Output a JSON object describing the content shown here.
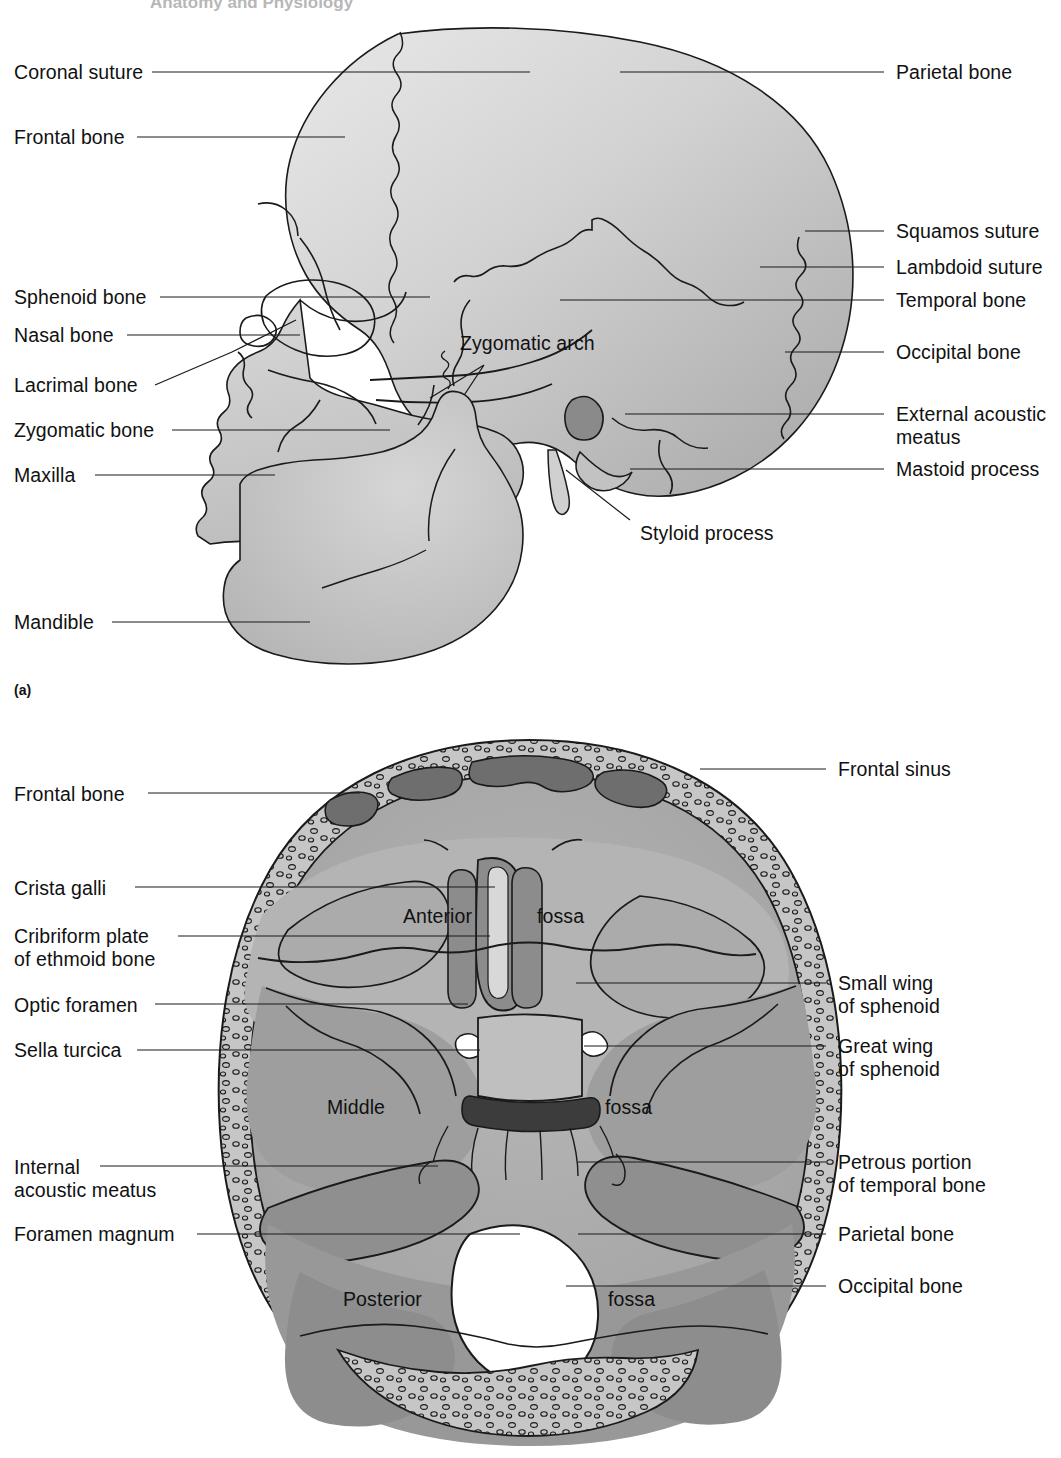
{
  "page": {
    "header_fragment": "Anatomy and Physiology"
  },
  "figures": [
    {
      "id": "lateral-skull",
      "panel_letter": "(a)",
      "view": "Lateral view of the skull",
      "labels_left": [
        {
          "text": "Coronal suture",
          "x": 14,
          "y": 60,
          "line_x1": 152,
          "line_x2": 530,
          "line_y": 72
        },
        {
          "text": "Frontal bone",
          "x": 14,
          "y": 125,
          "line_x1": 137,
          "line_x2": 345,
          "line_y": 137
        },
        {
          "text": "Sphenoid bone",
          "x": 14,
          "y": 285,
          "line_x1": 160,
          "line_x2": 430,
          "line_y": 297
        },
        {
          "text": "Nasal bone",
          "x": 14,
          "y": 323,
          "line_x1": 127,
          "line_x2": 300,
          "line_y": 335
        },
        {
          "text": "Lacrimal bone",
          "x": 14,
          "y": 378,
          "line_x1": 155,
          "line_x2": 232,
          "line_y": 385
        },
        {
          "text": "Zygomatic bone",
          "x": 14,
          "y": 418,
          "line_x1": 172,
          "line_x2": 390,
          "line_y": 430
        },
        {
          "text": "Maxilla",
          "x": 14,
          "y": 463,
          "line_x1": 95,
          "line_x2": 275,
          "line_y": 475
        },
        {
          "text": "Mandible",
          "x": 14,
          "y": 610,
          "line_x1": 112,
          "line_x2": 310,
          "line_y": 622
        }
      ],
      "labels_right": [
        {
          "text": "Parietal bone",
          "x": 896,
          "y": 60,
          "line_x1": 620,
          "line_x2": 884,
          "line_y": 72
        },
        {
          "text": "Squamos suture",
          "x": 896,
          "y": 219,
          "line_x1": 805,
          "line_x2": 884,
          "line_y": 231
        },
        {
          "text": "Lambdoid suture",
          "x": 896,
          "y": 255,
          "line_x1": 760,
          "line_x2": 884,
          "line_y": 267
        },
        {
          "text": "Temporal bone",
          "x": 896,
          "y": 288,
          "line_x1": 560,
          "line_x2": 884,
          "line_y": 300
        },
        {
          "text": "Occipital bone",
          "x": 896,
          "y": 340,
          "line_x1": 785,
          "line_x2": 884,
          "line_y": 352
        },
        {
          "text": "External acoustic",
          "x": 896,
          "y": 402,
          "line_x1": 625,
          "line_x2": 884,
          "line_y": 414
        },
        {
          "text": "meatus",
          "x": 896,
          "y": 425,
          "line_x1": 0,
          "line_x2": 0,
          "line_y": 0
        },
        {
          "text": "Mastoid process",
          "x": 896,
          "y": 457,
          "line_x1": 630,
          "line_x2": 884,
          "line_y": 469
        },
        {
          "text": "Styloid process",
          "x": 640,
          "y": 521,
          "line_x1": 0,
          "line_x2": 0,
          "line_y": 0
        }
      ],
      "inline_labels": [
        {
          "text": "Zygomatic arch",
          "x": 460,
          "y": 344
        }
      ]
    },
    {
      "id": "cranial-floor",
      "panel_letter": "",
      "view": "Superior view of the floor of the cranial cavity",
      "labels_left": [
        {
          "text": "Frontal bone",
          "x": 14,
          "y": 782,
          "line_x1": 148,
          "line_x2": 360,
          "line_y": 793
        },
        {
          "text": "Crista galli",
          "x": 14,
          "y": 876,
          "line_x1": 135,
          "line_x2": 495,
          "line_y": 887
        },
        {
          "text": "Cribriform plate",
          "x": 14,
          "y": 924,
          "line_x1": 178,
          "line_x2": 490,
          "line_y": 936
        },
        {
          "text": "of ethmoid bone",
          "x": 14,
          "y": 947,
          "line_x1": 0,
          "line_x2": 0,
          "line_y": 0
        },
        {
          "text": "Optic foramen",
          "x": 14,
          "y": 993,
          "line_x1": 155,
          "line_x2": 468,
          "line_y": 1004
        },
        {
          "text": "Sella turcica",
          "x": 14,
          "y": 1038,
          "line_x1": 137,
          "line_x2": 480,
          "line_y": 1050
        },
        {
          "text": "Internal",
          "x": 14,
          "y": 1155,
          "line_x1": 100,
          "line_x2": 438,
          "line_y": 1166
        },
        {
          "text": "acoustic meatus",
          "x": 14,
          "y": 1178,
          "line_x1": 0,
          "line_x2": 0,
          "line_y": 0
        },
        {
          "text": "Foramen magnum",
          "x": 14,
          "y": 1222,
          "line_x1": 197,
          "line_x2": 483,
          "line_y": 1234
        }
      ],
      "labels_right": [
        {
          "text": "Frontal sinus",
          "x": 838,
          "y": 757,
          "line_x1": 700,
          "line_x2": 826,
          "line_y": 769
        },
        {
          "text": "Small wing",
          "x": 838,
          "y": 971,
          "line_x1": 576,
          "line_x2": 826,
          "line_y": 983
        },
        {
          "text": "of sphenoid",
          "x": 838,
          "y": 994,
          "line_x1": 0,
          "line_x2": 0,
          "line_y": 0
        },
        {
          "text": "Great wing",
          "x": 838,
          "y": 1034,
          "line_x1": 584,
          "line_x2": 826,
          "line_y": 1046
        },
        {
          "text": "of sphenoid",
          "x": 838,
          "y": 1057,
          "line_x1": 0,
          "line_x2": 0,
          "line_y": 0
        },
        {
          "text": "Petrous portion",
          "x": 838,
          "y": 1150,
          "line_x1": 578,
          "line_x2": 826,
          "line_y": 1162
        },
        {
          "text": "of temporal bone",
          "x": 838,
          "y": 1173,
          "line_x1": 0,
          "line_x2": 0,
          "line_y": 0
        },
        {
          "text": "Parietal bone",
          "x": 838,
          "y": 1222,
          "line_x1": 578,
          "line_x2": 826,
          "line_y": 1234
        },
        {
          "text": "Occipital bone",
          "x": 838,
          "y": 1274,
          "line_x1": 566,
          "line_x2": 826,
          "line_y": 1286
        }
      ],
      "inline_labels": [
        {
          "text": "Anterior",
          "x": 403,
          "y": 917
        },
        {
          "text": "fossa",
          "x": 537,
          "y": 917
        },
        {
          "text": "Middle",
          "x": 327,
          "y": 1108
        },
        {
          "text": "fossa",
          "x": 605,
          "y": 1108
        },
        {
          "text": "Posterior",
          "x": 343,
          "y": 1300
        },
        {
          "text": "fossa",
          "x": 608,
          "y": 1300
        }
      ]
    }
  ],
  "panel_markers": [
    {
      "text": "(a)",
      "x": 14,
      "y": 682
    }
  ],
  "colors": {
    "bone_light": "#d3d3d3",
    "bone_mid": "#b8b8b8",
    "bone_dark": "#9a9a9a",
    "bone_darker": "#7f7f7f",
    "sinus": "#6e6e6e",
    "outline": "#1a1a1a",
    "leader": "#1a1a1a",
    "background": "#ffffff",
    "foramen": "#ffffff"
  }
}
